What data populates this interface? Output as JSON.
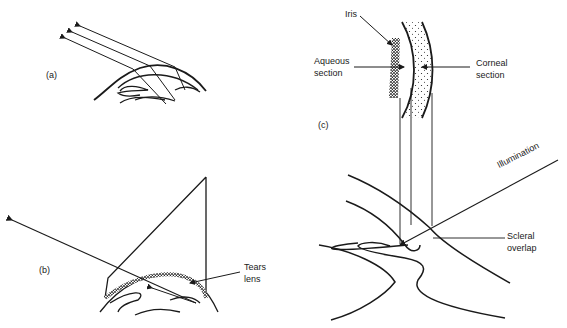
{
  "figure": {
    "panels": [
      {
        "id": "a",
        "label": "(a)"
      },
      {
        "id": "b",
        "label": "(b)"
      },
      {
        "id": "c",
        "label": "(c)"
      }
    ],
    "annotations": {
      "iris": "Iris",
      "aqueous_1": "Aqueous",
      "aqueous_2": "section",
      "corneal_1": "Corneal",
      "corneal_2": "section",
      "illumination": "Illumination",
      "scleral_1": "Scleral",
      "scleral_2": "overlap",
      "tears_1": "Tears",
      "tears_2": "lens"
    },
    "colors": {
      "ink": "#1a1a1a",
      "background": "#ffffff"
    }
  }
}
